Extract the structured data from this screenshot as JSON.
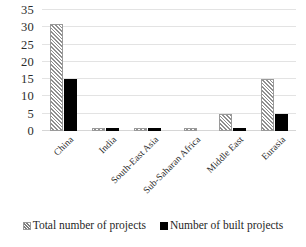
{
  "chart_data": {
    "type": "bar",
    "title": "",
    "subtitle": "",
    "xlabel": "",
    "ylabel": "",
    "ylim": [
      0,
      35
    ],
    "yticks": [
      0,
      5,
      10,
      15,
      20,
      25,
      30,
      35
    ],
    "grid": true,
    "legend_position": "bottom",
    "categories": [
      "China",
      "India",
      "South-East Asia",
      "Sub-Saharan Africa",
      "Middle East",
      "Eurasia"
    ],
    "series": [
      {
        "name": "Total number of projects",
        "style": "hatched",
        "color": "#ffffff",
        "values": [
          31,
          1,
          1,
          1,
          5,
          15
        ]
      },
      {
        "name": "Number of built projects",
        "style": "solid",
        "color": "#000000",
        "values": [
          15,
          1,
          1,
          0,
          1,
          5
        ]
      }
    ]
  },
  "axis": {
    "y_tick_labels": [
      "0",
      "5",
      "10",
      "15",
      "20",
      "25",
      "30",
      "35"
    ]
  },
  "legend": {
    "items": [
      {
        "label": "Total number of projects",
        "swatch": "hatched-square-icon"
      },
      {
        "label": "Number of built projects",
        "swatch": "black-square-icon"
      }
    ]
  }
}
